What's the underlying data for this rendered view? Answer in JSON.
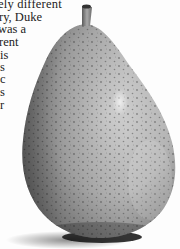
{
  "page": {
    "background": "#fdfdfd",
    "text_color": "#222222"
  },
  "text": {
    "lines": [
      "ely   different",
      "ry,  Duke",
      " was  a",
      "rent",
      "is",
      "s",
      "c",
      "s",
      "r"
    ]
  },
  "photo": {
    "subject": "pear",
    "style": "black-and-white photograph",
    "description": "Speckled pear with short stem, cast shadow at base"
  }
}
